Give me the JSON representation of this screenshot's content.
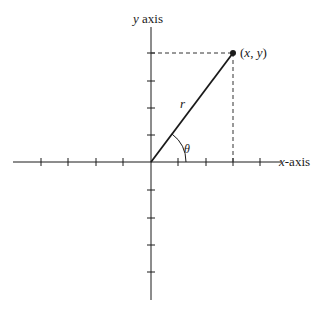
{
  "diagram": {
    "type": "polar-coordinates",
    "labels": {
      "y_axis_var": "y",
      "y_axis_word": " axis",
      "x_axis_var": "x",
      "x_axis_word": "-axis",
      "point": "(x, y)",
      "point_open": "(",
      "point_x": "x",
      "point_comma": ", ",
      "point_y": "y",
      "point_close": ")",
      "radius": "r",
      "angle": "θ"
    },
    "colors": {
      "line": "#1a1a1a",
      "dashed": "#333333",
      "background": "#ffffff"
    },
    "origin": {
      "x": 151,
      "y": 162
    },
    "point": {
      "x": 233,
      "y": 53
    },
    "x_axis": {
      "from": 13,
      "to": 280,
      "ticks": [
        41,
        68,
        96,
        123,
        178,
        206,
        233,
        260
      ]
    },
    "y_axis": {
      "from": 27,
      "to": 300,
      "ticks": [
        53,
        81,
        108,
        135,
        190,
        218,
        245,
        272
      ]
    }
  }
}
